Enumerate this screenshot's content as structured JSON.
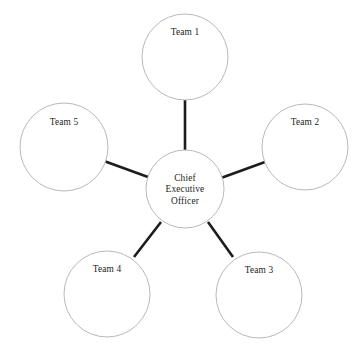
{
  "diagram": {
    "type": "hub-and-spoke organizational chart",
    "canvas": {
      "width": 363,
      "height": 353,
      "background": "#ffffff"
    },
    "style": {
      "node_fill": "#ffffff",
      "node_stroke": "#b9b9bd",
      "node_stroke_width": 1,
      "connector_color": "#1c1c1c",
      "connector_width": 2.6,
      "text_color": "#231f20"
    },
    "center_node": {
      "id": "chief-executive-officer",
      "lines": [
        "Chief",
        "Executive",
        "Officer"
      ],
      "full_label": "Chief Executive Officer",
      "cx": 185,
      "cy": 189,
      "r": 39
    },
    "team_nodes": [
      {
        "id": "team-1",
        "label": "Team 1",
        "cx": 185,
        "cy": 57,
        "r": 43,
        "label_dy": -22
      },
      {
        "id": "team-2",
        "label": "Team 2",
        "cx": 305,
        "cy": 147,
        "r": 43,
        "label_dy": -22
      },
      {
        "id": "team-3",
        "label": "Team 3",
        "cx": 259,
        "cy": 295,
        "r": 43,
        "label_dy": -22
      },
      {
        "id": "team-4",
        "label": "Team 4",
        "cx": 107,
        "cy": 294,
        "r": 43,
        "label_dy": -22
      },
      {
        "id": "team-5",
        "label": "Team 5",
        "cx": 64,
        "cy": 147,
        "r": 44,
        "label_dy": -22
      }
    ],
    "connectors": [
      {
        "id": "link-ceo-team-1",
        "from": "chief-executive-officer",
        "to": "team-1",
        "x1": 185,
        "y1": 150,
        "x2": 185,
        "y2": 100
      },
      {
        "id": "link-ceo-team-2",
        "from": "chief-executive-officer",
        "to": "team-2",
        "x1": 221,
        "y1": 178,
        "x2": 265,
        "y2": 162
      },
      {
        "id": "link-ceo-team-3",
        "from": "chief-executive-officer",
        "to": "team-3",
        "x1": 208,
        "y1": 222,
        "x2": 233,
        "y2": 257
      },
      {
        "id": "link-ceo-team-4",
        "from": "chief-executive-officer",
        "to": "team-4",
        "x1": 161,
        "y1": 222,
        "x2": 134,
        "y2": 257
      },
      {
        "id": "link-ceo-team-5",
        "from": "chief-executive-officer",
        "to": "team-5",
        "x1": 148,
        "y1": 177,
        "x2": 104,
        "y2": 161
      }
    ]
  }
}
